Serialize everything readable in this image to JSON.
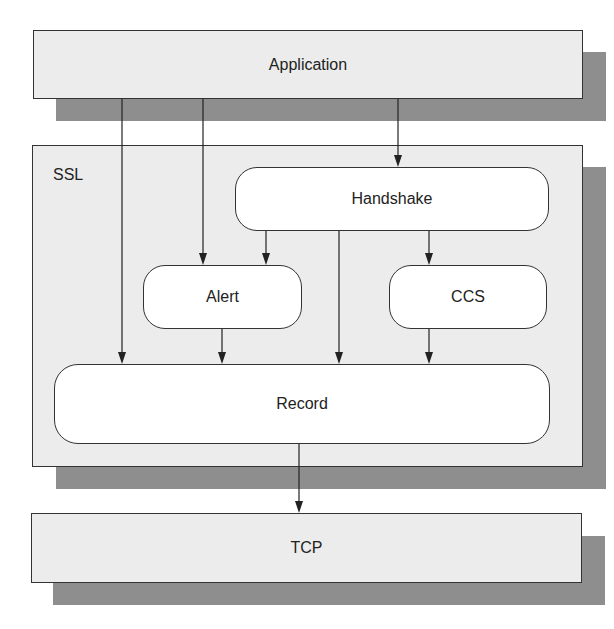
{
  "diagram": {
    "colors": {
      "shadow": "#8e8e8e",
      "layer_fill": "#ececec",
      "box_fill": "#ffffff",
      "line": "#222222"
    },
    "layers": {
      "application": {
        "label": "Application"
      },
      "ssl": {
        "label": "SSL"
      },
      "tcp": {
        "label": "TCP"
      }
    },
    "subprotocols": {
      "handshake": {
        "label": "Handshake"
      },
      "alert": {
        "label": "Alert"
      },
      "ccs": {
        "label": "CCS"
      },
      "record": {
        "label": "Record"
      }
    },
    "edges": [
      {
        "from": "Application",
        "to": "Record"
      },
      {
        "from": "Application",
        "to": "Alert"
      },
      {
        "from": "Application",
        "to": "Handshake"
      },
      {
        "from": "Handshake",
        "to": "Alert"
      },
      {
        "from": "Handshake",
        "to": "Record"
      },
      {
        "from": "Handshake",
        "to": "CCS"
      },
      {
        "from": "Alert",
        "to": "Record"
      },
      {
        "from": "CCS",
        "to": "Record"
      },
      {
        "from": "Record",
        "to": "TCP"
      }
    ]
  }
}
